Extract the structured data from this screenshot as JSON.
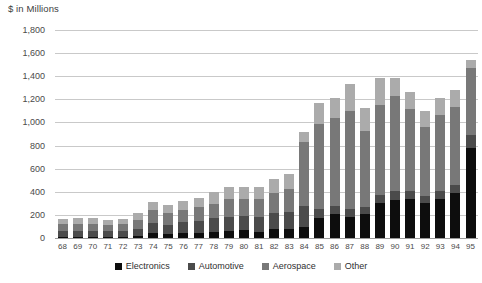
{
  "axis_title": "$ in Millions",
  "legend": {
    "items": [
      {
        "label": "Electronics",
        "color": "#0d0d0d",
        "key": "electronics"
      },
      {
        "label": "Automotive",
        "color": "#4b4b4b",
        "key": "automotive"
      },
      {
        "label": "Aerospace",
        "color": "#787878",
        "key": "aerospace"
      },
      {
        "label": "Other",
        "color": "#ababab",
        "key": "other"
      }
    ]
  },
  "chart_data": {
    "type": "bar",
    "stacked": true,
    "title": "$ in Millions",
    "xlabel": "",
    "ylabel": "$ in Millions",
    "ylim": [
      0,
      1800
    ],
    "ytick_step": 200,
    "grid": true,
    "legend_position": "bottom",
    "ytick_labels": [
      "1,800",
      "1,600",
      "1,400",
      "1,200",
      "1,000",
      "800",
      "600",
      "400",
      "200",
      "0"
    ],
    "ytick_values": [
      1800,
      1600,
      1400,
      1200,
      1000,
      800,
      600,
      400,
      200,
      0
    ],
    "categories": [
      "68",
      "69",
      "70",
      "71",
      "72",
      "73",
      "74",
      "75",
      "76",
      "77",
      "78",
      "79",
      "80",
      "81",
      "82",
      "83",
      "84",
      "85",
      "86",
      "87",
      "88",
      "89",
      "90",
      "91",
      "92",
      "93",
      "94",
      "95"
    ],
    "series": [
      {
        "name": "Electronics",
        "color": "#0d0d0d",
        "values": [
          10,
          10,
          10,
          10,
          10,
          15,
          40,
          35,
          40,
          45,
          50,
          60,
          70,
          55,
          75,
          80,
          95,
          175,
          210,
          185,
          210,
          305,
          330,
          340,
          300,
          340,
          390,
          780
        ]
      },
      {
        "name": "Automotive",
        "color": "#4b4b4b",
        "values": [
          55,
          55,
          55,
          50,
          55,
          60,
          90,
          80,
          95,
          105,
          120,
          125,
          120,
          125,
          140,
          145,
          180,
          75,
          65,
          65,
          60,
          70,
          75,
          70,
          60,
          70,
          70,
          110
        ]
      },
      {
        "name": "Aerospace",
        "color": "#787878",
        "values": [
          60,
          60,
          60,
          55,
          60,
          85,
          110,
          105,
          110,
          115,
          125,
          155,
          150,
          160,
          175,
          200,
          560,
          735,
          760,
          845,
          655,
          775,
          825,
          710,
          600,
          655,
          670,
          580
        ]
      },
      {
        "name": "Other",
        "color": "#ababab",
        "values": [
          40,
          45,
          45,
          40,
          40,
          55,
          75,
          70,
          75,
          80,
          100,
          105,
          100,
          105,
          120,
          125,
          85,
          180,
          175,
          240,
          200,
          235,
          155,
          140,
          140,
          145,
          150,
          75
        ]
      }
    ],
    "totals": [
      165,
      170,
      170,
      155,
      165,
      215,
      315,
      290,
      320,
      345,
      395,
      445,
      440,
      445,
      510,
      550,
      920,
      1165,
      1210,
      1335,
      1125,
      1385,
      1385,
      1260,
      1100,
      1210,
      1280,
      1545
    ]
  }
}
